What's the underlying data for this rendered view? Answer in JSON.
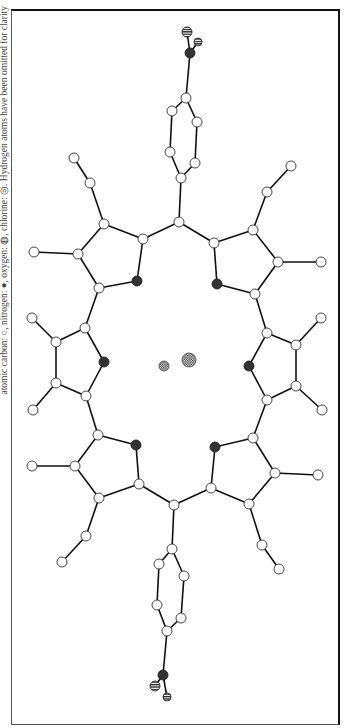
{
  "caption": "atomic carbon: ○, nitrogen: ●, oxygen: ◍, chlorine: ◎. Hydrogen atoms have been omitted for clarity",
  "legend": {
    "carbon": "open circle",
    "nitrogen": "filled dark circle",
    "oxygen": "horizontally striped circle",
    "chlorine": "checkered circle"
  },
  "colors": {
    "bond": "#111111",
    "carbon_fill": "#ffffff",
    "nitrogen_fill": "#333333",
    "frame": "#111111"
  },
  "atoms": [
    {
      "id": "O1",
      "type": "oxygen",
      "x": 187,
      "y": 32,
      "r": 5
    },
    {
      "id": "O2",
      "type": "oxygen",
      "x": 198,
      "y": 42,
      "r": 4
    },
    {
      "id": "Nn1",
      "type": "nitrogen",
      "x": 190,
      "y": 53,
      "r": 5
    },
    {
      "id": "Cp1",
      "type": "carbon",
      "x": 186,
      "y": 98,
      "r": 5
    },
    {
      "id": "Cp2",
      "type": "carbon",
      "x": 172,
      "y": 111,
      "r": 5
    },
    {
      "id": "Cp3",
      "type": "carbon",
      "x": 197,
      "y": 122,
      "r": 5
    },
    {
      "id": "Cp4",
      "type": "carbon",
      "x": 170,
      "y": 152,
      "r": 5
    },
    {
      "id": "Cp5",
      "type": "carbon",
      "x": 195,
      "y": 163,
      "r": 5
    },
    {
      "id": "Cp6",
      "type": "carbon",
      "x": 181,
      "y": 178,
      "r": 5
    },
    {
      "id": "Cm1",
      "type": "carbon",
      "x": 179,
      "y": 222,
      "r": 5
    },
    {
      "id": "A1",
      "type": "carbon",
      "x": 143,
      "y": 239,
      "r": 5
    },
    {
      "id": "A2",
      "type": "carbon",
      "x": 104,
      "y": 224,
      "r": 5
    },
    {
      "id": "A3",
      "type": "carbon",
      "x": 78,
      "y": 254,
      "r": 5
    },
    {
      "id": "A4",
      "type": "carbon",
      "x": 99,
      "y": 288,
      "r": 5
    },
    {
      "id": "NA",
      "type": "nitrogen",
      "x": 137,
      "y": 281,
      "r": 5
    },
    {
      "id": "A5",
      "type": "carbon",
      "x": 90,
      "y": 183,
      "r": 5
    },
    {
      "id": "A6",
      "type": "carbon",
      "x": 74,
      "y": 158,
      "r": 5
    },
    {
      "id": "A7",
      "type": "carbon",
      "x": 34,
      "y": 252,
      "r": 5
    },
    {
      "id": "B1",
      "type": "carbon",
      "x": 214,
      "y": 243,
      "r": 5
    },
    {
      "id": "B2",
      "type": "carbon",
      "x": 253,
      "y": 230,
      "r": 5
    },
    {
      "id": "B3",
      "type": "carbon",
      "x": 278,
      "y": 262,
      "r": 5
    },
    {
      "id": "B4",
      "type": "carbon",
      "x": 255,
      "y": 294,
      "r": 5
    },
    {
      "id": "NB",
      "type": "nitrogen",
      "x": 217,
      "y": 284,
      "r": 5
    },
    {
      "id": "B5",
      "type": "carbon",
      "x": 267,
      "y": 192,
      "r": 5
    },
    {
      "id": "B6",
      "type": "carbon",
      "x": 291,
      "y": 166,
      "r": 5
    },
    {
      "id": "B7",
      "type": "carbon",
      "x": 321,
      "y": 262,
      "r": 5
    },
    {
      "id": "C1",
      "type": "carbon",
      "x": 99,
      "y": 288,
      "r": 5
    },
    {
      "id": "C2",
      "type": "carbon",
      "x": 85,
      "y": 328,
      "r": 5
    },
    {
      "id": "C3",
      "type": "carbon",
      "x": 56,
      "y": 342,
      "r": 5
    },
    {
      "id": "C4",
      "type": "carbon",
      "x": 56,
      "y": 383,
      "r": 5
    },
    {
      "id": "C5",
      "type": "carbon",
      "x": 86,
      "y": 396,
      "r": 5
    },
    {
      "id": "NC",
      "type": "nitrogen",
      "x": 104,
      "y": 362,
      "r": 5
    },
    {
      "id": "C6",
      "type": "carbon",
      "x": 32,
      "y": 318,
      "r": 5
    },
    {
      "id": "C7",
      "type": "carbon",
      "x": 33,
      "y": 410,
      "r": 5
    },
    {
      "id": "D1",
      "type": "carbon",
      "x": 255,
      "y": 294,
      "r": 5
    },
    {
      "id": "D2",
      "type": "carbon",
      "x": 267,
      "y": 333,
      "r": 5
    },
    {
      "id": "D3",
      "type": "carbon",
      "x": 296,
      "y": 345,
      "r": 5
    },
    {
      "id": "D4",
      "type": "carbon",
      "x": 296,
      "y": 386,
      "r": 5
    },
    {
      "id": "D5",
      "type": "carbon",
      "x": 267,
      "y": 400,
      "r": 5
    },
    {
      "id": "ND",
      "type": "nitrogen",
      "x": 249,
      "y": 366,
      "r": 5
    },
    {
      "id": "D6",
      "type": "carbon",
      "x": 321,
      "y": 318,
      "r": 5
    },
    {
      "id": "D7",
      "type": "carbon",
      "x": 322,
      "y": 410,
      "r": 5
    },
    {
      "id": "E1",
      "type": "carbon",
      "x": 98,
      "y": 435,
      "r": 5
    },
    {
      "id": "NE",
      "type": "nitrogen",
      "x": 136,
      "y": 445,
      "r": 5
    },
    {
      "id": "E2",
      "type": "carbon",
      "x": 139,
      "y": 484,
      "r": 5
    },
    {
      "id": "E3",
      "type": "carbon",
      "x": 99,
      "y": 498,
      "r": 5
    },
    {
      "id": "E4",
      "type": "carbon",
      "x": 75,
      "y": 466,
      "r": 5
    },
    {
      "id": "E5",
      "type": "carbon",
      "x": 86,
      "y": 536,
      "r": 5
    },
    {
      "id": "E6",
      "type": "carbon",
      "x": 62,
      "y": 562,
      "r": 5
    },
    {
      "id": "E7",
      "type": "carbon",
      "x": 32,
      "y": 466,
      "r": 5
    },
    {
      "id": "F1",
      "type": "carbon",
      "x": 253,
      "y": 438,
      "r": 5
    },
    {
      "id": "NF",
      "type": "nitrogen",
      "x": 215,
      "y": 447,
      "r": 5
    },
    {
      "id": "F2",
      "type": "carbon",
      "x": 211,
      "y": 488,
      "r": 5
    },
    {
      "id": "F3",
      "type": "carbon",
      "x": 249,
      "y": 504,
      "r": 5
    },
    {
      "id": "F4",
      "type": "carbon",
      "x": 275,
      "y": 473,
      "r": 5
    },
    {
      "id": "F5",
      "type": "carbon",
      "x": 262,
      "y": 545,
      "r": 5
    },
    {
      "id": "F6",
      "type": "carbon",
      "x": 279,
      "y": 569,
      "r": 5
    },
    {
      "id": "F7",
      "type": "carbon",
      "x": 318,
      "y": 475,
      "r": 5
    },
    {
      "id": "Cm2",
      "type": "carbon",
      "x": 174,
      "y": 505,
      "r": 5
    },
    {
      "id": "Cq1",
      "type": "carbon",
      "x": 172,
      "y": 549,
      "r": 5
    },
    {
      "id": "Cq2",
      "type": "carbon",
      "x": 159,
      "y": 564,
      "r": 5
    },
    {
      "id": "Cq3",
      "type": "carbon",
      "x": 184,
      "y": 576,
      "r": 5
    },
    {
      "id": "Cq4",
      "type": "carbon",
      "x": 157,
      "y": 605,
      "r": 5
    },
    {
      "id": "Cq5",
      "type": "carbon",
      "x": 181,
      "y": 618,
      "r": 5
    },
    {
      "id": "Cq6",
      "type": "carbon",
      "x": 167,
      "y": 631,
      "r": 5
    },
    {
      "id": "Nn2",
      "type": "nitrogen",
      "x": 163,
      "y": 675,
      "r": 5
    },
    {
      "id": "O3",
      "type": "oxygen",
      "x": 155,
      "y": 686,
      "r": 5
    },
    {
      "id": "O4",
      "type": "oxygen",
      "x": 167,
      "y": 697,
      "r": 4
    },
    {
      "id": "Cl1",
      "type": "chlorine",
      "x": 164,
      "y": 366,
      "r": 5
    },
    {
      "id": "Cl2",
      "type": "chlorine",
      "x": 189,
      "y": 360,
      "r": 7
    }
  ],
  "bonds": [
    [
      "O1",
      "Nn1"
    ],
    [
      "O2",
      "Nn1"
    ],
    [
      "Nn1",
      "Cp1"
    ],
    [
      "Cp1",
      "Cp2"
    ],
    [
      "Cp1",
      "Cp3"
    ],
    [
      "Cp2",
      "Cp4"
    ],
    [
      "Cp3",
      "Cp5"
    ],
    [
      "Cp4",
      "Cp6"
    ],
    [
      "Cp5",
      "Cp6"
    ],
    [
      "Cp6",
      "Cm1"
    ],
    [
      "Cm1",
      "A1"
    ],
    [
      "A1",
      "A2"
    ],
    [
      "A2",
      "A3"
    ],
    [
      "A3",
      "A4"
    ],
    [
      "A4",
      "NA"
    ],
    [
      "NA",
      "A1"
    ],
    [
      "A2",
      "A5"
    ],
    [
      "A5",
      "A6"
    ],
    [
      "A3",
      "A7"
    ],
    [
      "Cm1",
      "B1"
    ],
    [
      "B1",
      "B2"
    ],
    [
      "B2",
      "B3"
    ],
    [
      "B3",
      "B4"
    ],
    [
      "B4",
      "NB"
    ],
    [
      "NB",
      "B1"
    ],
    [
      "B2",
      "B5"
    ],
    [
      "B5",
      "B6"
    ],
    [
      "B3",
      "B7"
    ],
    [
      "A4",
      "C2"
    ],
    [
      "C2",
      "C3"
    ],
    [
      "C3",
      "C4"
    ],
    [
      "C4",
      "C5"
    ],
    [
      "C5",
      "NC"
    ],
    [
      "NC",
      "C2"
    ],
    [
      "C3",
      "C6"
    ],
    [
      "C4",
      "C7"
    ],
    [
      "B4",
      "D2"
    ],
    [
      "D2",
      "D3"
    ],
    [
      "D3",
      "D4"
    ],
    [
      "D4",
      "D5"
    ],
    [
      "D5",
      "ND"
    ],
    [
      "ND",
      "D2"
    ],
    [
      "D3",
      "D6"
    ],
    [
      "D4",
      "D7"
    ],
    [
      "C5",
      "E1"
    ],
    [
      "E1",
      "NE"
    ],
    [
      "NE",
      "E2"
    ],
    [
      "E2",
      "E3"
    ],
    [
      "E3",
      "E4"
    ],
    [
      "E4",
      "E1"
    ],
    [
      "E3",
      "E5"
    ],
    [
      "E5",
      "E6"
    ],
    [
      "E4",
      "E7"
    ],
    [
      "D5",
      "F1"
    ],
    [
      "F1",
      "NF"
    ],
    [
      "NF",
      "F2"
    ],
    [
      "F2",
      "F3"
    ],
    [
      "F3",
      "F4"
    ],
    [
      "F4",
      "F1"
    ],
    [
      "F3",
      "F5"
    ],
    [
      "F5",
      "F6"
    ],
    [
      "F4",
      "F7"
    ],
    [
      "E2",
      "Cm2"
    ],
    [
      "F2",
      "Cm2"
    ],
    [
      "Cm2",
      "Cq1"
    ],
    [
      "Cq1",
      "Cq2"
    ],
    [
      "Cq1",
      "Cq3"
    ],
    [
      "Cq2",
      "Cq4"
    ],
    [
      "Cq3",
      "Cq5"
    ],
    [
      "Cq4",
      "Cq6"
    ],
    [
      "Cq5",
      "Cq6"
    ],
    [
      "Cq6",
      "Nn2"
    ],
    [
      "Nn2",
      "O3"
    ],
    [
      "Nn2",
      "O4"
    ]
  ]
}
